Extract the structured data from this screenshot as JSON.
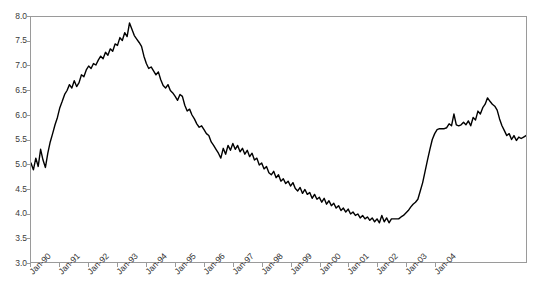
{
  "chart_data": {
    "type": "line",
    "title": "",
    "xlabel": "",
    "ylabel": "",
    "ylim": [
      3.0,
      8.0
    ],
    "ytick_labels": [
      "8.0",
      "7.5",
      "7.0",
      "6.5",
      "6.0",
      "5.5",
      "5.0",
      "4.5",
      "4.0",
      "3.5",
      "3.0"
    ],
    "ytick_values": [
      8.0,
      7.5,
      7.0,
      6.5,
      6.0,
      5.5,
      5.0,
      4.5,
      4.0,
      3.5,
      3.0
    ],
    "grid": false,
    "legend": "none",
    "line_color": "#000000",
    "axis_color": "#9a9a9a",
    "background": "#ffffff",
    "xtick_labels": [
      "Jan-90",
      "Jan-91",
      "Jan-92",
      "Jan-93",
      "Jan-94",
      "Jan-95",
      "Jan-96",
      "Jan-97",
      "Jan-98",
      "Jan-99",
      "Jan-00",
      "Jan-01",
      "Jan-02",
      "Jan-03",
      "Jan-04"
    ],
    "x_start": "Jan-90",
    "x_end": "Jul-04",
    "x_frequency": "monthly",
    "series": [
      {
        "name": "rate",
        "values": [
          5.02,
          4.88,
          5.12,
          4.95,
          5.3,
          5.08,
          4.93,
          5.22,
          5.45,
          5.62,
          5.8,
          5.95,
          6.15,
          6.28,
          6.42,
          6.5,
          6.62,
          6.55,
          6.7,
          6.58,
          6.66,
          6.82,
          6.78,
          6.92,
          7.0,
          6.95,
          7.05,
          7.02,
          7.12,
          7.2,
          7.15,
          7.28,
          7.22,
          7.35,
          7.3,
          7.45,
          7.42,
          7.58,
          7.52,
          7.68,
          7.6,
          7.88,
          7.75,
          7.62,
          7.55,
          7.48,
          7.4,
          7.2,
          7.05,
          6.95,
          6.98,
          6.9,
          6.82,
          6.88,
          6.72,
          6.6,
          6.55,
          6.62,
          6.5,
          6.45,
          6.38,
          6.3,
          6.42,
          6.38,
          6.2,
          6.08,
          6.12,
          6.0,
          5.92,
          5.82,
          5.75,
          5.78,
          5.7,
          5.62,
          5.58,
          5.45,
          5.38,
          5.3,
          5.22,
          5.12,
          5.32,
          5.2,
          5.38,
          5.28,
          5.42,
          5.3,
          5.38,
          5.25,
          5.32,
          5.2,
          5.28,
          5.15,
          5.22,
          5.08,
          5.12,
          4.98,
          5.02,
          4.9,
          4.95,
          4.82,
          4.78,
          4.85,
          4.72,
          4.78,
          4.65,
          4.7,
          4.6,
          4.65,
          4.55,
          4.62,
          4.5,
          4.45,
          4.52,
          4.4,
          4.48,
          4.38,
          4.42,
          4.3,
          4.38,
          4.28,
          4.32,
          4.22,
          4.3,
          4.18,
          4.25,
          4.15,
          4.2,
          4.1,
          4.15,
          4.05,
          4.1,
          4.02,
          4.08,
          3.98,
          4.02,
          3.95,
          3.98,
          3.9,
          3.95,
          3.88,
          3.92,
          3.85,
          3.9,
          3.82,
          3.88,
          3.8,
          3.95,
          3.82,
          3.9,
          3.8,
          3.88,
          3.88,
          3.88,
          3.88,
          3.92,
          3.95,
          4.0,
          4.05,
          4.12,
          4.18,
          4.22,
          4.28,
          4.45,
          4.62,
          4.85,
          5.08,
          5.3,
          5.5,
          5.62,
          5.7,
          5.72,
          5.72,
          5.72,
          5.74,
          5.82,
          5.78,
          6.02,
          5.8,
          5.78,
          5.8,
          5.85,
          5.8,
          5.88,
          5.78,
          5.95,
          5.9,
          6.08,
          6.02,
          6.15,
          6.22,
          6.35,
          6.28,
          6.22,
          6.18,
          6.1,
          5.92,
          5.78,
          5.68,
          5.58,
          5.62,
          5.5,
          5.58,
          5.48,
          5.55,
          5.52,
          5.55,
          5.58
        ]
      }
    ]
  }
}
